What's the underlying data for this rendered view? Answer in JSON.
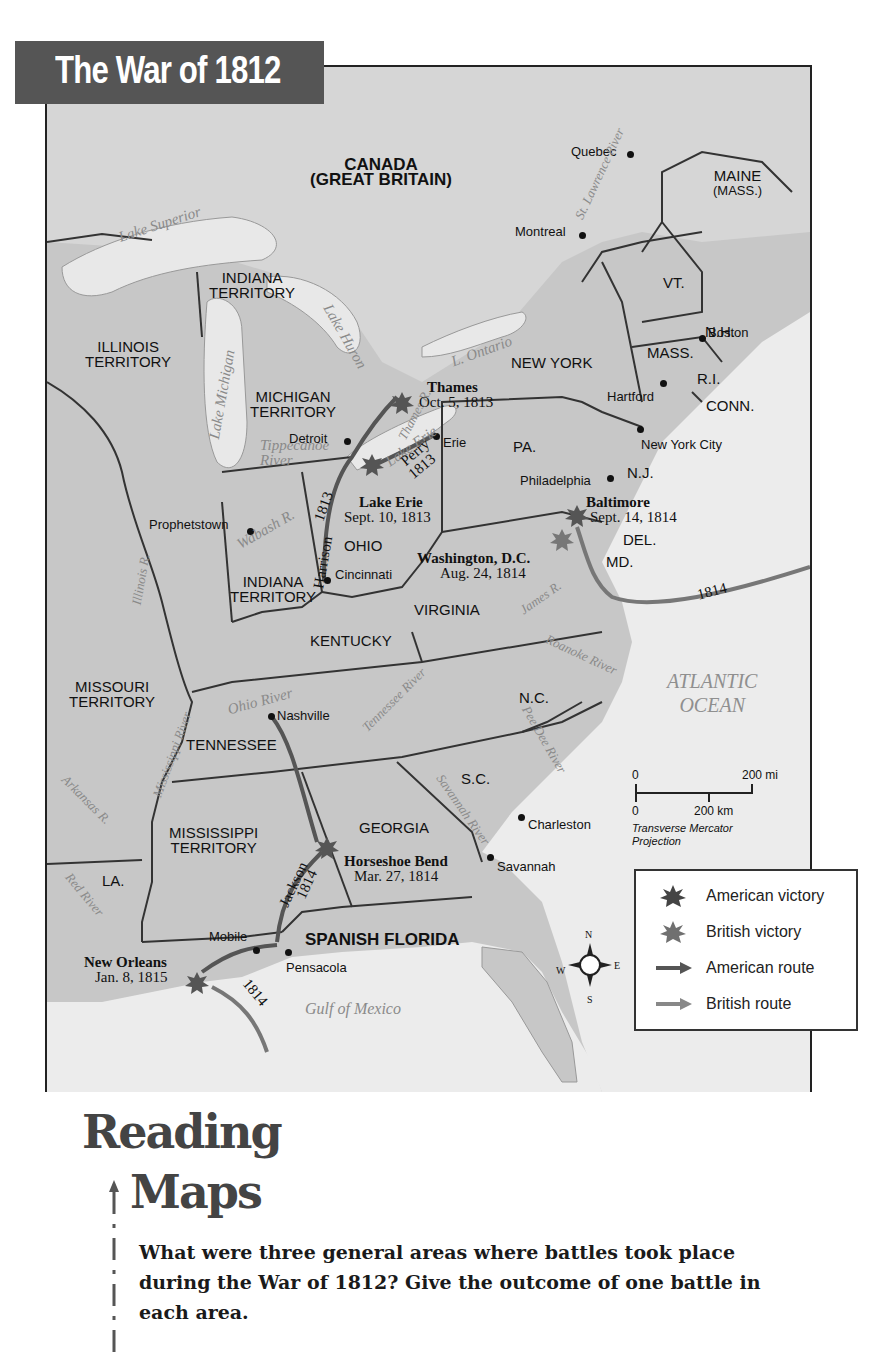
{
  "title": "The War of 1812",
  "map": {
    "countries": [
      {
        "name": "CANADA",
        "sub": "(GREAT BRITAIN)"
      }
    ],
    "regions": [
      {
        "id": "indiana-territory-north",
        "line1": "INDIANA",
        "line2": "TERRITORY"
      },
      {
        "id": "illinois-territory",
        "line1": "ILLINOIS",
        "line2": "TERRITORY"
      },
      {
        "id": "michigan-territory",
        "line1": "MICHIGAN",
        "line2": "TERRITORY"
      },
      {
        "id": "indiana-territory",
        "line1": "INDIANA",
        "line2": "TERRITORY"
      },
      {
        "id": "missouri-territory",
        "line1": "MISSOURI",
        "line2": "TERRITORY"
      },
      {
        "id": "mississippi-territory",
        "line1": "MISSISSIPPI",
        "line2": "TERRITORY"
      },
      {
        "id": "maine",
        "line1": "MAINE",
        "line2": "(MASS.)"
      },
      {
        "id": "ohio",
        "line1": "OHIO"
      },
      {
        "id": "kentucky",
        "line1": "KENTUCKY"
      },
      {
        "id": "tennessee",
        "line1": "TENNESSEE"
      },
      {
        "id": "virginia",
        "line1": "VIRGINIA"
      },
      {
        "id": "new-york",
        "line1": "NEW YORK"
      },
      {
        "id": "pa",
        "line1": "PA."
      },
      {
        "id": "vt",
        "line1": "VT."
      },
      {
        "id": "nh",
        "line1": "N.H."
      },
      {
        "id": "mass",
        "line1": "MASS."
      },
      {
        "id": "ri",
        "line1": "R.I."
      },
      {
        "id": "conn",
        "line1": "CONN."
      },
      {
        "id": "nj",
        "line1": "N.J."
      },
      {
        "id": "del",
        "line1": "DEL."
      },
      {
        "id": "md",
        "line1": "MD."
      },
      {
        "id": "nc",
        "line1": "N.C."
      },
      {
        "id": "sc",
        "line1": "S.C."
      },
      {
        "id": "georgia",
        "line1": "GEORGIA"
      },
      {
        "id": "la",
        "line1": "LA."
      },
      {
        "id": "spanish-florida",
        "line1": "SPANISH FLORIDA"
      }
    ],
    "cities": [
      "Quebec",
      "Montreal",
      "Boston",
      "Hartford",
      "New York City",
      "Philadelphia",
      "Erie",
      "Detroit",
      "Prophetstown",
      "Cincinnati",
      "Nashville",
      "Charleston",
      "Savannah",
      "Mobile",
      "Pensacola"
    ],
    "waters": {
      "lake_superior": "Lake Superior",
      "lake_michigan": "Lake Michigan",
      "lake_huron": "Lake Huron",
      "lake_ontario": "L. Ontario",
      "lake_erie": "Lake Erie",
      "st_lawrence": "St. Lawrence River",
      "thames": "Thames R.",
      "tippecanoe": "Tippecanoe",
      "tippecanoe2": "River",
      "wabash": "Wabash R.",
      "illinois": "Illinois R.",
      "ohio": "Ohio River",
      "mississippi": "Mississippi River",
      "tennessee": "Tennessee River",
      "james": "James R.",
      "roanoke": "Roanoke River",
      "pee_dee": "Pee Dee River",
      "savannah": "Savannah River",
      "arkansas": "Arkansas R.",
      "red": "Red River",
      "atlantic1": "ATLANTIC",
      "atlantic2": "OCEAN",
      "gulf": "Gulf of Mexico"
    },
    "battles": [
      {
        "name": "Thames",
        "date": "Oct. 5, 1813",
        "outcome": "American victory"
      },
      {
        "name": "Lake Erie",
        "date": "Sept. 10, 1813",
        "outcome": "American victory"
      },
      {
        "name": "Baltimore",
        "date": "Sept. 14, 1814",
        "outcome": "American victory"
      },
      {
        "name": "Washington, D.C.",
        "date": "Aug. 24, 1814",
        "outcome": "British victory"
      },
      {
        "name": "Horseshoe Bend",
        "date": "Mar. 27, 1814",
        "outcome": "American victory"
      },
      {
        "name": "New Orleans",
        "date": "Jan. 8, 1815",
        "outcome": "American victory"
      }
    ],
    "routes": {
      "harrison": "Harrison",
      "harrison_year": "1813",
      "perry": "Perry",
      "perry_year": "1813",
      "jackson": "Jackson",
      "jackson_year": "1814",
      "british_chesapeake": "1814",
      "british_gulf": "1814"
    },
    "scale": {
      "mi_zero": "0",
      "mi_label": "200 mi",
      "km_zero": "0",
      "km_label": "200 km",
      "projection_line1": "Transverse Mercator",
      "projection_line2": "Projection"
    },
    "compass": {
      "n": "N",
      "s": "S",
      "e": "E",
      "w": "W"
    }
  },
  "legend": {
    "items": [
      {
        "label": "American victory",
        "symbol": "star",
        "color": "#444444"
      },
      {
        "label": "British victory",
        "symbol": "star",
        "color": "#6f6f6f"
      },
      {
        "label": "American route",
        "symbol": "arrow",
        "color": "#555555"
      },
      {
        "label": "British route",
        "symbol": "arrow",
        "color": "#888888"
      }
    ]
  },
  "reading_maps": {
    "heading_line1": "Reading",
    "heading_line2": "Maps",
    "question": "What were three general areas where battles took place during the War of 1812? Give the outcome of one battle in each area."
  },
  "colors": {
    "title_bg": "#555555",
    "land": "#c9c9c9",
    "water": "#ececec",
    "american": "#444444",
    "british": "#7a7a7a"
  }
}
